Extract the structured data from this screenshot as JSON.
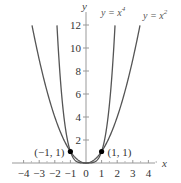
{
  "chart_data": {
    "type": "line",
    "title": "",
    "xlabel": "x",
    "ylabel": "y",
    "xlim": [
      -4.5,
      4.5
    ],
    "ylim": [
      0,
      13
    ],
    "grid": false,
    "x_ticks": [
      -4,
      -3,
      -2,
      -1,
      0,
      1,
      2,
      3,
      4
    ],
    "x_tick_labels": [
      "−4",
      "−3",
      "−2",
      "−1",
      "0",
      "1",
      "2",
      "3",
      "4"
    ],
    "y_ticks": [
      2,
      4,
      6,
      8,
      10,
      12
    ],
    "y_tick_labels": [
      "2",
      "4",
      "6",
      "8",
      "10",
      "12"
    ],
    "series": [
      {
        "name": "y = x^4",
        "label_main": "y = x",
        "label_exp": "4",
        "function": "x^4",
        "x_range": [
          -1.86,
          1.86
        ],
        "color": "#555555"
      },
      {
        "name": "y = x^2",
        "label_main": "y = x",
        "label_exp": "2",
        "function": "x^2",
        "x_range": [
          -3.46,
          3.46
        ],
        "color": "#555555"
      }
    ],
    "points": [
      {
        "x": -1,
        "y": 1,
        "label": "(−1, 1)"
      },
      {
        "x": 1,
        "y": 1,
        "label": "(1, 1)"
      }
    ],
    "annotations": [
      "y = x⁴",
      "y = x²",
      "(−1, 1)",
      "(1, 1)"
    ]
  }
}
